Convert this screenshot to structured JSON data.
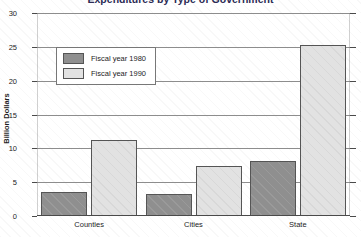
{
  "chart_data": {
    "type": "bar",
    "title": "Expenditures by Type of Government",
    "xlabel": "",
    "ylabel": "Billion Dollars",
    "categories": [
      "Counties",
      "Cities",
      "State"
    ],
    "series": [
      {
        "name": "Fiscal year 1980",
        "color": "#8f8f8f",
        "values": [
          3.5,
          3.2,
          8.2
        ]
      },
      {
        "name": "Fiscal year 1990",
        "color": "#e2e2e2",
        "values": [
          11.2,
          7.4,
          25.3
        ]
      }
    ],
    "ylim": [
      0,
      30
    ],
    "yticks": [
      0,
      5,
      10,
      15,
      20,
      25,
      30
    ],
    "ytick_labels": [
      "0",
      "5",
      "10",
      "15",
      "20",
      "25",
      "30"
    ],
    "grid": true,
    "legend_position": "upper left"
  }
}
